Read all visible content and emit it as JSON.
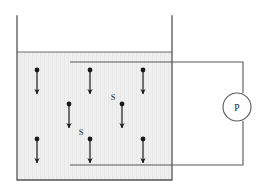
{
  "figure": {
    "background_color": "#ffffff",
    "stroke_color": "#4d4d4d",
    "ink_color": "#1a1a1a",
    "liquid_fill_color": "#f0f0f0",
    "liquid_stripe_color": "#e6e6e6"
  },
  "container": {
    "name": "liquid-container",
    "left_wall_x": 17,
    "right_wall_x": 172,
    "top_y": 16,
    "bottom_y": 180,
    "liquid_surface_y": 52,
    "wall_width": 1.3
  },
  "electrodes": {
    "top": {
      "label": "top-electrode",
      "x1": 70,
      "x2": 243,
      "y": 62
    },
    "bottom": {
      "label": "bottom-electrode",
      "x1": 70,
      "x2": 243,
      "y": 165
    },
    "right_wire_x": 243,
    "wire_width": 1.1
  },
  "meter": {
    "name": "pressure-meter",
    "label": "P",
    "cx": 237,
    "cy": 107,
    "r": 14,
    "stroke": "#4d4d4d"
  },
  "arrows": [
    {
      "id": "arrow-1",
      "x": 37,
      "y_top": 70,
      "y_bottom": 94,
      "label": null
    },
    {
      "id": "arrow-2",
      "x": 90,
      "y_top": 70,
      "y_bottom": 94,
      "label": null
    },
    {
      "id": "arrow-3",
      "x": 143,
      "y_top": 70,
      "y_bottom": 94,
      "label": null
    },
    {
      "id": "arrow-4",
      "x": 69,
      "y_top": 104,
      "y_bottom": 128,
      "label": null
    },
    {
      "id": "arrow-5",
      "x": 122,
      "y_top": 104,
      "y_bottom": 128,
      "label": "S"
    },
    {
      "id": "arrow-6",
      "x": 37,
      "y_top": 139,
      "y_bottom": 163,
      "label": null
    },
    {
      "id": "arrow-7",
      "x": 90,
      "y_top": 139,
      "y_bottom": 163,
      "label": "S"
    },
    {
      "id": "arrow-8",
      "x": 143,
      "y_top": 139,
      "y_bottom": 163,
      "label": null
    }
  ],
  "arrow_style": {
    "shaft_width": 1.2,
    "dot_radius": 2.4,
    "head_width": 4.2,
    "head_length": 6
  },
  "labels": {
    "particle_symbol": "S",
    "meter_symbol": "P",
    "s_label_offset_x": -9,
    "s_label_offset_y": -4
  }
}
